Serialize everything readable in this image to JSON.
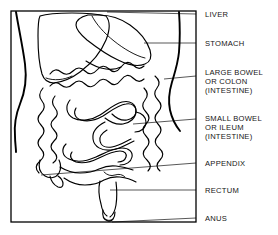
{
  "figure": {
    "background_color": "#ffffff",
    "ink_color": "#000000",
    "label_color": "#161616",
    "frame": {
      "x": 11,
      "y": 11,
      "width": 185,
      "height": 211
    }
  },
  "labels": [
    {
      "id": "liver",
      "lines": [
        "LIVER"
      ],
      "text_x": 205,
      "text_y": 17,
      "leader": {
        "x1": 107,
        "y1": 12,
        "x2": 196,
        "y2": 14
      }
    },
    {
      "id": "stomach",
      "lines": [
        "STOMACH"
      ],
      "text_x": 205,
      "text_y": 46,
      "leader": {
        "x1": 144,
        "y1": 43,
        "x2": 196,
        "y2": 43
      }
    },
    {
      "id": "large-bowel",
      "lines": [
        "LARGE BOWEL",
        "OR COLON",
        "(INTESTINE)"
      ],
      "text_x": 205,
      "text_y": 75,
      "leader": {
        "x1": 164,
        "y1": 79,
        "x2": 196,
        "y2": 76
      }
    },
    {
      "id": "small-bowel",
      "lines": [
        "SMALL BOWEL",
        "OR ILEUM",
        "(INTESTINE)"
      ],
      "text_x": 205,
      "text_y": 121,
      "leader": {
        "x1": 133,
        "y1": 124,
        "x2": 196,
        "y2": 119
      }
    },
    {
      "id": "appendix",
      "lines": [
        "APPENDIX"
      ],
      "text_x": 205,
      "text_y": 166,
      "leader": {
        "x1": 41,
        "y1": 175,
        "x2": 196,
        "y2": 163
      }
    },
    {
      "id": "rectum",
      "lines": [
        "RECTUM"
      ],
      "text_x": 205,
      "text_y": 193,
      "leader": {
        "x1": 110,
        "y1": 190,
        "x2": 196,
        "y2": 190
      }
    },
    {
      "id": "anus",
      "lines": [
        "ANUS"
      ],
      "text_x": 205,
      "text_y": 221,
      "leader": {
        "x1": 112,
        "y1": 222,
        "x2": 196,
        "y2": 218
      }
    }
  ],
  "organs": [
    {
      "id": "liver",
      "name": "liver"
    },
    {
      "id": "stomach",
      "name": "stomach"
    },
    {
      "id": "large-bowel",
      "name": "large bowel or colon"
    },
    {
      "id": "small-bowel",
      "name": "small bowel or ileum"
    },
    {
      "id": "appendix",
      "name": "appendix"
    },
    {
      "id": "rectum",
      "name": "rectum"
    },
    {
      "id": "anus",
      "name": "anus"
    },
    {
      "id": "torso",
      "name": "body outline"
    }
  ]
}
